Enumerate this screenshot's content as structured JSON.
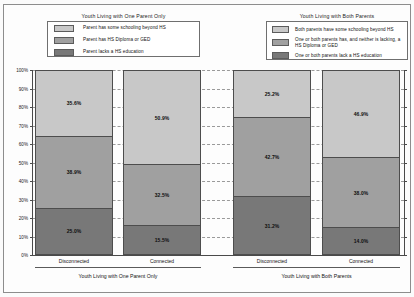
{
  "legends": [
    {
      "title": "Youth Living with One Parent Only",
      "items": [
        {
          "label": "Parent has some schooling beyond HS",
          "color": "#c8c8c8"
        },
        {
          "label": "Parent has HS Diploma or GED",
          "color": "#a0a0a0"
        },
        {
          "label": "Parent lacks a HS education",
          "color": "#787878"
        }
      ]
    },
    {
      "title": "Youth Living with Both  Parents",
      "items": [
        {
          "label": "Both parents have some schooling beyond HS",
          "color": "#c8c8c8"
        },
        {
          "label": "One or both parents has, and neither is lacking, a HS Diploma or GED",
          "color": "#a0a0a0"
        },
        {
          "label": "One or both parents lack a HS education",
          "color": "#787878"
        }
      ]
    }
  ],
  "axis": {
    "ytick_labels": [
      "100%",
      "90%",
      "80%",
      "70%",
      "60%",
      "50%",
      "40%",
      "30%",
      "20%",
      "10%",
      "0%"
    ],
    "ymin": 0,
    "ymax": 100
  },
  "groups": [
    {
      "title": "Youth Living with One Parent Only",
      "categories": [
        "Disconnected",
        "Connected"
      ]
    },
    {
      "title": "Youth Living with Both Parents",
      "categories": [
        "Disconnected",
        "Connected"
      ]
    }
  ],
  "bars": [
    {
      "group": "Youth Living with One Parent Only",
      "category": "Disconnected",
      "segments": [
        {
          "label": "35.6%",
          "value": 35.6,
          "color": "#c8c8c8"
        },
        {
          "label": "38.9%",
          "value": 38.9,
          "color": "#a0a0a0"
        },
        {
          "label": "25.0%",
          "value": 25.0,
          "color": "#787878"
        }
      ]
    },
    {
      "group": "Youth Living with One Parent Only",
      "category": "Connected",
      "segments": [
        {
          "label": "50.9%",
          "value": 50.9,
          "color": "#c8c8c8"
        },
        {
          "label": "32.5%",
          "value": 32.5,
          "color": "#a0a0a0"
        },
        {
          "label": "15.5%",
          "value": 15.5,
          "color": "#787878"
        }
      ]
    },
    {
      "group": "Youth Living with Both Parents",
      "category": "Disconnected",
      "segments": [
        {
          "label": "25.2%",
          "value": 25.2,
          "color": "#c8c8c8"
        },
        {
          "label": "42.7%",
          "value": 42.7,
          "color": "#a0a0a0"
        },
        {
          "label": "31.2%",
          "value": 31.2,
          "color": "#787878"
        }
      ]
    },
    {
      "group": "Youth Living with Both Parents",
      "category": "Connected",
      "segments": [
        {
          "label": "46.9%",
          "value": 46.9,
          "color": "#c8c8c8"
        },
        {
          "label": "38.0%",
          "value": 38.0,
          "color": "#a0a0a0"
        },
        {
          "label": "14.0%",
          "value": 14.0,
          "color": "#787878"
        }
      ]
    }
  ],
  "chart_data": {
    "type": "bar",
    "subtype": "100% stacked column",
    "title": "",
    "xlabel": "",
    "ylabel": "",
    "ylim": [
      0,
      100
    ],
    "ytick_labels": [
      "0%",
      "10%",
      "20%",
      "30%",
      "40%",
      "50%",
      "60%",
      "70%",
      "80%",
      "90%",
      "100%"
    ],
    "grid": true,
    "grid_style": "dashed horizontal",
    "legend_position": "top",
    "categories": [
      "One Parent Only - Disconnected",
      "One Parent Only - Connected",
      "Both Parents - Disconnected",
      "Both Parents - Connected"
    ],
    "series": [
      {
        "name": "Parent(s) lack a HS education",
        "color": "#787878",
        "values": [
          25.0,
          15.5,
          31.2,
          14.0
        ]
      },
      {
        "name": "Parent(s) has HS Diploma or GED",
        "color": "#a0a0a0",
        "values": [
          38.9,
          32.5,
          42.7,
          38.0
        ]
      },
      {
        "name": "Parent(s) has some schooling beyond HS",
        "color": "#c8c8c8",
        "values": [
          35.6,
          50.9,
          25.2,
          46.9
        ]
      }
    ]
  }
}
